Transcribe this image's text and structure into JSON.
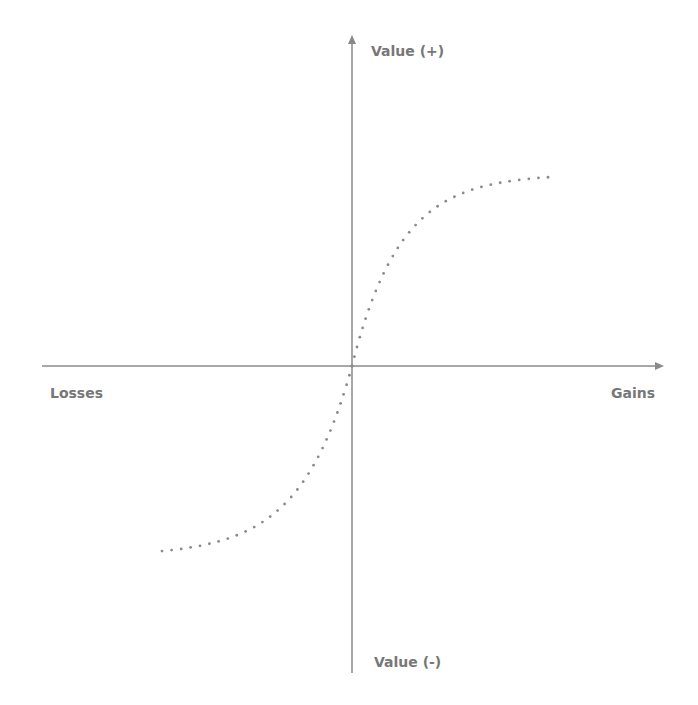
{
  "diagram": {
    "type": "value-function",
    "labels": {
      "y_positive": "Value (+)",
      "y_negative": "Value (-)",
      "x_negative": "Losses",
      "x_positive": "Gains"
    },
    "colors": {
      "axis": "#8a8a8a",
      "curve": "#8a8a8a",
      "text": "#777777"
    }
  },
  "chart_data": {
    "type": "line",
    "title": "",
    "xlabel": "Gains / Losses",
    "ylabel": "Value",
    "x_axis_labels": {
      "negative": "Losses",
      "positive": "Gains"
    },
    "y_axis_labels": {
      "positive": "Value (+)",
      "negative": "Value (-)"
    },
    "grid": false,
    "style": "dotted",
    "series": [
      {
        "name": "value curve",
        "shape": "S-shaped, concave for gains, convex for losses, passing through origin",
        "x_range": [
          -1,
          1
        ],
        "y_range": [
          -1,
          1
        ]
      }
    ]
  }
}
